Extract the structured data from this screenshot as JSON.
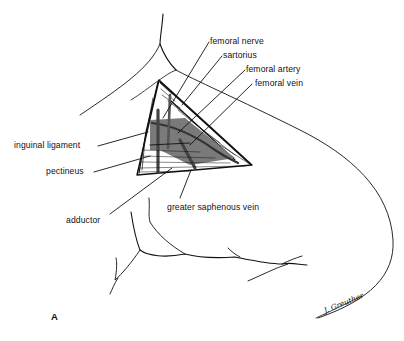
{
  "figure": {
    "panel_label": "A",
    "signature": "J. Greuther",
    "colors": {
      "ink": "#111111",
      "vessel_shading": "#7a7a7a",
      "background": "#ffffff"
    }
  },
  "labels": [
    {
      "id": "femoral-nerve",
      "text": "femoral nerve"
    },
    {
      "id": "sartorius",
      "text": "sartorius"
    },
    {
      "id": "femoral-artery",
      "text": "femoral artery"
    },
    {
      "id": "femoral-vein",
      "text": "femoral vein"
    },
    {
      "id": "inguinal-ligament",
      "text": "inguinal ligament"
    },
    {
      "id": "pectineus",
      "text": "pectineus"
    },
    {
      "id": "adductor",
      "text": "adductor"
    },
    {
      "id": "greater-saphenous-vein",
      "text": "greater saphenous vein"
    }
  ]
}
